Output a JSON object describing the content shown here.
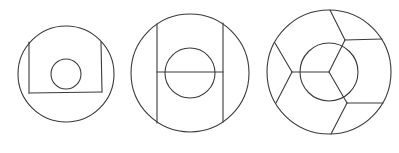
{
  "canvas": {
    "width": 399,
    "height": 153,
    "background": "#ffffff",
    "stroke_color": "#3a3a3a"
  },
  "figures": [
    {
      "id": "figure-1",
      "description": "Circle with inscribed open square (U-shape) and small inner circle",
      "outer_circle": {
        "cx": 66,
        "cy": 74,
        "r": 48
      },
      "inner_circle": {
        "cx": 66,
        "cy": 74,
        "r": 15
      },
      "lines": [
        {
          "x1": 29,
          "y1": 42,
          "x2": 29,
          "y2": 93
        },
        {
          "x1": 29,
          "y1": 93,
          "x2": 102,
          "y2": 92
        },
        {
          "x1": 102,
          "y1": 92,
          "x2": 101,
          "y2": 42
        }
      ]
    },
    {
      "id": "figure-2",
      "description": "Circle with two vertical chords joined by a horizontal bar through an inner circle (H shape)",
      "outer_circle": {
        "cx": 190,
        "cy": 73,
        "r": 59
      },
      "inner_circle": {
        "cx": 190,
        "cy": 73,
        "r": 25
      },
      "lines": [
        {
          "x1": 157,
          "y1": 24,
          "x2": 157,
          "y2": 123
        },
        {
          "x1": 223,
          "y1": 23,
          "x2": 223,
          "y2": 122
        },
        {
          "x1": 157,
          "y1": 72,
          "x2": 223,
          "y2": 72
        }
      ]
    },
    {
      "id": "figure-3",
      "description": "Circle with inner circle and a three-way Y junction at center; each arm forks at the outer ring into cells",
      "outer_circle": {
        "cx": 329,
        "cy": 72,
        "r": 62
      },
      "inner_circle": {
        "cx": 329,
        "cy": 72,
        "r": 29
      },
      "lines": [
        {
          "x1": 329,
          "y1": 72,
          "x2": 345,
          "y2": 40
        },
        {
          "x1": 329,
          "y1": 72,
          "x2": 347,
          "y2": 103
        },
        {
          "x1": 329,
          "y1": 72,
          "x2": 292,
          "y2": 72
        },
        {
          "x1": 345,
          "y1": 40,
          "x2": 330,
          "y2": 10
        },
        {
          "x1": 345,
          "y1": 40,
          "x2": 382,
          "y2": 39
        },
        {
          "x1": 347,
          "y1": 103,
          "x2": 383,
          "y2": 103
        },
        {
          "x1": 347,
          "y1": 103,
          "x2": 331,
          "y2": 134
        },
        {
          "x1": 292,
          "y1": 72,
          "x2": 275,
          "y2": 43
        },
        {
          "x1": 292,
          "y1": 72,
          "x2": 276,
          "y2": 103
        }
      ]
    }
  ]
}
